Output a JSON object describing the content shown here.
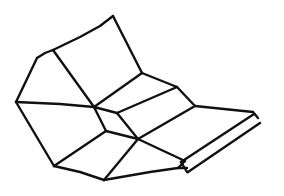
{
  "figure": {
    "width": 284,
    "height": 196,
    "background": "#ffffff",
    "stroke_color": "#111111",
    "stroke_width": 2.4
  },
  "lines": [
    {
      "id": "top-edge-left",
      "points": [
        [
          37,
          58
        ],
        [
          45,
          53
        ],
        [
          53,
          50
        ]
      ]
    },
    {
      "id": "top-edge",
      "points": [
        [
          53,
          50
        ],
        [
          80,
          37
        ],
        [
          100,
          26
        ],
        [
          113,
          16
        ]
      ]
    },
    {
      "id": "right-top-edge",
      "points": [
        [
          113,
          16
        ],
        [
          142,
          73
        ]
      ]
    },
    {
      "id": "left-outer-edge",
      "points": [
        [
          37,
          58
        ],
        [
          16,
          102
        ]
      ]
    },
    {
      "id": "inner-fold-left",
      "points": [
        [
          53,
          50
        ],
        [
          94,
          107
        ]
      ]
    },
    {
      "id": "horizontal-fold-1",
      "points": [
        [
          16,
          102
        ],
        [
          60,
          104
        ],
        [
          94,
          107
        ]
      ]
    },
    {
      "id": "top-panel-bottom",
      "points": [
        [
          94,
          107
        ],
        [
          142,
          73
        ]
      ]
    },
    {
      "id": "strip-1-top",
      "points": [
        [
          142,
          73
        ],
        [
          177,
          87
        ]
      ]
    },
    {
      "id": "strip-1-bottom",
      "points": [
        [
          117,
          113
        ],
        [
          177,
          87
        ]
      ]
    },
    {
      "id": "strip-1-end",
      "points": [
        [
          177,
          87
        ],
        [
          195,
          106
        ]
      ]
    },
    {
      "id": "junction-e-j",
      "points": [
        [
          94,
          107
        ],
        [
          117,
          113
        ]
      ]
    },
    {
      "id": "strip-2-bottom",
      "points": [
        [
          138,
          139
        ],
        [
          195,
          106
        ]
      ]
    },
    {
      "id": "strip-2-left",
      "points": [
        [
          117,
          113
        ],
        [
          138,
          139
        ]
      ]
    },
    {
      "id": "ribbon-top",
      "points": [
        [
          195,
          106
        ],
        [
          253,
          112
        ]
      ]
    },
    {
      "id": "diag-e-l",
      "points": [
        [
          94,
          107
        ],
        [
          106,
          131
        ]
      ]
    },
    {
      "id": "diag-l-n",
      "points": [
        [
          106,
          131
        ],
        [
          54,
          166
        ]
      ]
    },
    {
      "id": "left-lower-edge",
      "points": [
        [
          16,
          102
        ],
        [
          54,
          166
        ]
      ]
    },
    {
      "id": "bottom-left-edge",
      "points": [
        [
          54,
          166
        ],
        [
          80,
          172
        ],
        [
          104,
          180
        ]
      ]
    },
    {
      "id": "diag-k-p",
      "points": [
        [
          138,
          139
        ],
        [
          104,
          180
        ]
      ]
    },
    {
      "id": "l-k",
      "points": [
        [
          106,
          131
        ],
        [
          138,
          139
        ]
      ]
    },
    {
      "id": "k-q",
      "points": [
        [
          138,
          139
        ],
        [
          185,
          161
        ]
      ]
    },
    {
      "id": "bottom-right-edge",
      "points": [
        [
          104,
          180
        ],
        [
          150,
          172
        ],
        [
          178,
          168
        ],
        [
          187,
          168
        ]
      ]
    },
    {
      "id": "ribbon-inner-edge",
      "points": [
        [
          181,
          162
        ],
        [
          254,
          114
        ]
      ]
    },
    {
      "id": "ribbon-outer-edge",
      "points": [
        [
          188,
          172
        ],
        [
          260,
          123
        ]
      ]
    },
    {
      "id": "ribbon-end-cap",
      "points": [
        [
          253,
          112
        ],
        [
          258,
          118
        ]
      ]
    },
    {
      "id": "ribbon-near-cap",
      "points": [
        [
          181,
          162
        ],
        [
          187,
          172
        ],
        [
          188,
          172
        ]
      ]
    },
    {
      "id": "ribbon-near-join",
      "points": [
        [
          178,
          168
        ],
        [
          185,
          161
        ],
        [
          181,
          162
        ]
      ]
    }
  ]
}
